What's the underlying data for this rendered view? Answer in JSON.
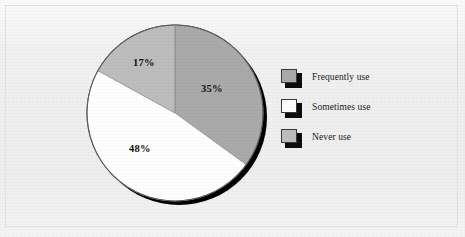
{
  "figure": {
    "background_color": "#f1f1f1",
    "border_color": "#e2e2e2"
  },
  "chart_data": {
    "type": "pie",
    "title": "",
    "subtitle": "",
    "xlabel": "",
    "ylabel": "",
    "categories": [
      "Frequently use",
      "Sometimes use",
      "Never use"
    ],
    "values": [
      35,
      48,
      17
    ],
    "value_labels": [
      "35%",
      "48%",
      "17%"
    ],
    "colors": [
      "#aaaaaa",
      "#ffffff",
      "#bdbdbd"
    ],
    "start_angle_deg": 0,
    "direction": "clockwise",
    "grid": false,
    "legend": {
      "position": "right",
      "entries": [
        {
          "label": "Frequently use",
          "color": "#aaaaaa"
        },
        {
          "label": "Sometimes use",
          "color": "#ffffff"
        },
        {
          "label": "Never use",
          "color": "#bdbdbd"
        }
      ]
    },
    "annotations": [
      {
        "text": "35%",
        "slice": "Frequently use"
      },
      {
        "text": "48%",
        "slice": "Sometimes use"
      },
      {
        "text": "17%",
        "slice": "Never use"
      }
    ],
    "style": {
      "has_drop_shadow": true,
      "shadow_color": "#000000",
      "outline_color": "#555555"
    }
  },
  "slice_positions": {
    "frequently": {
      "left": 201,
      "top": 83
    },
    "sometimes": {
      "left": 129,
      "top": 143
    },
    "never": {
      "left": 133,
      "top": 57
    }
  }
}
